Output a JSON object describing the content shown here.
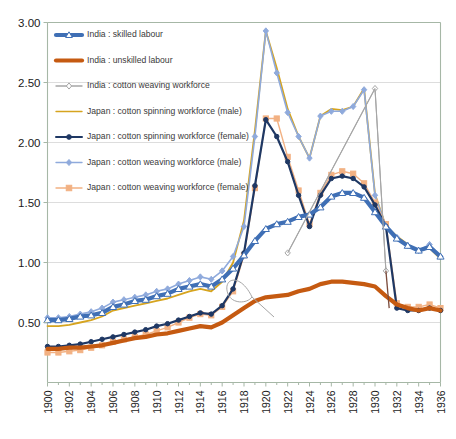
{
  "chart_data": {
    "type": "line",
    "title": "",
    "subtitle": "",
    "xlabel": "",
    "ylabel": "",
    "xlim": [
      1900,
      1936
    ],
    "ylim": [
      0.0,
      3.0
    ],
    "yticks": [
      "0.50",
      "1.00",
      "1.50",
      "2.00",
      "2.50",
      "3.00"
    ],
    "ytick_values": [
      0.5,
      1.0,
      1.5,
      2.0,
      2.5,
      3.0
    ],
    "grid": "horizontal",
    "legend_position": "top-left-inside",
    "x": [
      1900,
      1901,
      1902,
      1903,
      1904,
      1905,
      1906,
      1907,
      1908,
      1909,
      1910,
      1911,
      1912,
      1913,
      1914,
      1915,
      1916,
      1917,
      1918,
      1919,
      1920,
      1921,
      1922,
      1923,
      1924,
      1925,
      1926,
      1927,
      1928,
      1929,
      1930,
      1931,
      1932,
      1933,
      1934,
      1935,
      1936
    ],
    "xtick_labels": [
      "1900",
      "1902",
      "1904",
      "1906",
      "1908",
      "1910",
      "1912",
      "1914",
      "1916",
      "1918",
      "1920",
      "1922",
      "1924",
      "1926",
      "1928",
      "1930",
      "1932",
      "1934",
      "1936"
    ],
    "series": [
      {
        "name": "India : skilled labour",
        "color": "#3f6fb5",
        "marker": "triangle",
        "marker_color": "#ffffff",
        "width": 4.2,
        "values": [
          0.52,
          0.52,
          0.53,
          0.55,
          0.56,
          0.58,
          0.63,
          0.65,
          0.68,
          0.69,
          0.72,
          0.74,
          0.78,
          0.8,
          0.82,
          0.8,
          0.86,
          0.95,
          1.06,
          1.18,
          1.28,
          1.32,
          1.34,
          1.38,
          1.4,
          1.46,
          1.55,
          1.58,
          1.58,
          1.54,
          1.42,
          1.3,
          1.2,
          1.14,
          1.1,
          1.13,
          1.05
        ]
      },
      {
        "name": "India : unskilled labour",
        "color": "#c55a11",
        "marker": "none",
        "width": 4.2,
        "values": [
          0.28,
          0.28,
          0.29,
          0.29,
          0.3,
          0.31,
          0.33,
          0.35,
          0.37,
          0.38,
          0.4,
          0.41,
          0.43,
          0.45,
          0.47,
          0.46,
          0.5,
          0.56,
          0.62,
          0.68,
          0.71,
          0.72,
          0.73,
          0.76,
          0.78,
          0.82,
          0.84,
          0.84,
          0.83,
          0.82,
          0.8,
          0.72,
          0.65,
          0.62,
          0.6,
          0.62,
          0.6
        ]
      },
      {
        "name": "India : cotton weaving workforce",
        "color": "#a6a6a6",
        "marker": "diamond-open",
        "width": 1.0,
        "values": [
          null,
          null,
          null,
          null,
          null,
          null,
          null,
          null,
          null,
          null,
          null,
          null,
          null,
          null,
          null,
          null,
          null,
          null,
          null,
          null,
          null,
          null,
          1.08,
          null,
          null,
          null,
          null,
          null,
          null,
          null,
          2.45,
          0.93,
          null,
          null,
          null,
          null,
          null
        ]
      },
      {
        "name": "Japan : cotton spinning workforce (male)",
        "color": "#d6a41f",
        "marker": "none",
        "width": 1.8,
        "values": [
          0.47,
          0.47,
          0.48,
          0.5,
          0.52,
          0.55,
          0.6,
          0.62,
          0.64,
          0.66,
          0.68,
          0.7,
          0.73,
          0.76,
          0.78,
          0.76,
          0.84,
          1.0,
          1.35,
          2.1,
          2.93,
          2.62,
          2.28,
          2.05,
          1.87,
          2.22,
          2.28,
          2.27,
          2.3,
          2.45,
          1.57,
          1.3,
          1.22,
          1.15,
          1.1,
          1.12,
          1.03
        ]
      },
      {
        "name": "Japan : cotton spinning workforce (female)",
        "color": "#1f3864",
        "marker": "circle",
        "width": 2.2,
        "values": [
          0.3,
          0.3,
          0.31,
          0.32,
          0.34,
          0.36,
          0.38,
          0.4,
          0.42,
          0.44,
          0.47,
          0.49,
          0.52,
          0.55,
          0.58,
          0.57,
          0.64,
          0.78,
          1.08,
          1.64,
          2.19,
          2.05,
          1.84,
          1.56,
          1.3,
          1.56,
          1.7,
          1.72,
          1.7,
          1.63,
          1.48,
          1.3,
          0.62,
          0.6,
          0.6,
          0.62,
          0.6
        ]
      },
      {
        "name": "Japan : cotton weaving workforce (male)",
        "color": "#8faadc",
        "marker": "diamond",
        "width": 1.6,
        "values": [
          0.54,
          0.54,
          0.55,
          0.57,
          0.59,
          0.62,
          0.67,
          0.69,
          0.71,
          0.73,
          0.76,
          0.78,
          0.82,
          0.85,
          0.88,
          0.86,
          0.93,
          1.05,
          1.3,
          2.05,
          2.93,
          2.58,
          2.25,
          2.05,
          1.87,
          2.22,
          2.26,
          2.26,
          2.3,
          2.44,
          1.56,
          1.3,
          1.21,
          1.14,
          1.1,
          1.15,
          1.05
        ]
      },
      {
        "name": "Japan : cotton weaving workforce (female)",
        "color": "#f2b183",
        "marker": "square",
        "width": 1.4,
        "values": [
          0.25,
          0.25,
          0.26,
          0.27,
          0.29,
          0.31,
          0.34,
          0.36,
          0.38,
          0.4,
          0.43,
          0.46,
          0.5,
          0.54,
          0.57,
          0.56,
          0.63,
          0.76,
          1.06,
          1.62,
          2.2,
          2.2,
          1.88,
          1.6,
          1.32,
          1.58,
          1.73,
          1.76,
          1.74,
          1.66,
          1.5,
          1.32,
          0.66,
          0.63,
          0.63,
          0.65,
          0.62
        ]
      }
    ]
  },
  "legend": {
    "items": [
      {
        "label": "India : skilled labour"
      },
      {
        "label": "India : unskilled labour"
      },
      {
        "label": "India : cotton weaving workforce"
      },
      {
        "label": "Japan : cotton spinning workforce (male)"
      },
      {
        "label": "Japan : cotton spinning workforce (female)"
      },
      {
        "label": "Japan : cotton weaving workforce (male)"
      },
      {
        "label": "Japan : cotton weaving workforce (female)"
      }
    ]
  },
  "axes": {
    "y_labels": [
      "3.00",
      "2.50",
      "2.00",
      "1.50",
      "1.00",
      "0.50"
    ],
    "x_labels": [
      "1900",
      "1902",
      "1904",
      "1906",
      "1908",
      "1910",
      "1912",
      "1914",
      "1916",
      "1918",
      "1920",
      "1922",
      "1924",
      "1926",
      "1928",
      "1930",
      "1932",
      "1934",
      "1936"
    ]
  },
  "colors": {
    "india_skilled": "#3f6fb5",
    "india_unskilled": "#c55a11",
    "india_weaving": "#a6a6a6",
    "japan_spin_male": "#d6a41f",
    "japan_spin_female": "#1f3864",
    "japan_weave_male": "#8faadc",
    "japan_weave_female": "#f2b183",
    "grid": "#d9d9d9",
    "axis": "#a6b7a6"
  }
}
